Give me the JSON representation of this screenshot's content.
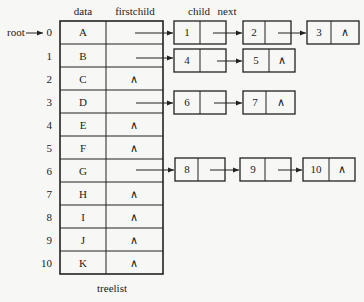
{
  "diagram": {
    "type": "child-linked-list tree representation",
    "caption": "treelist",
    "root_label": "root",
    "root_index": 0,
    "headers": {
      "data": "data",
      "firstchild": "firstchild",
      "child": "child",
      "next": "next"
    },
    "null_symbol": "∧",
    "rows": [
      {
        "index": "0",
        "data": "A",
        "firstchild": "",
        "children": [
          "1",
          "2",
          "3"
        ]
      },
      {
        "index": "1",
        "data": "B",
        "firstchild": "",
        "children": [
          "4",
          "5"
        ]
      },
      {
        "index": "2",
        "data": "C",
        "firstchild": "∧",
        "children": []
      },
      {
        "index": "3",
        "data": "D",
        "firstchild": "",
        "children": [
          "6",
          "7"
        ]
      },
      {
        "index": "4",
        "data": "E",
        "firstchild": "∧",
        "children": []
      },
      {
        "index": "5",
        "data": "F",
        "firstchild": "∧",
        "children": []
      },
      {
        "index": "6",
        "data": "G",
        "firstchild": "",
        "children": [
          "8",
          "9",
          "10"
        ]
      },
      {
        "index": "7",
        "data": "H",
        "firstchild": "∧",
        "children": []
      },
      {
        "index": "8",
        "data": "I",
        "firstchild": "∧",
        "children": []
      },
      {
        "index": "9",
        "data": "J",
        "firstchild": "∧",
        "children": []
      },
      {
        "index": "10",
        "data": "K",
        "firstchild": "∧",
        "children": []
      }
    ],
    "colors": {
      "line": "#222222",
      "background": "#f7f7f5"
    }
  }
}
